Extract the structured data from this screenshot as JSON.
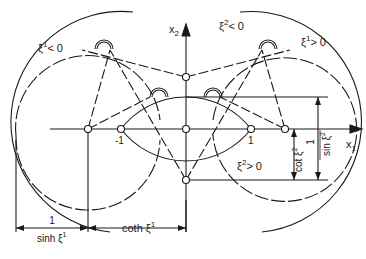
{
  "diagram": {
    "type": "bipolar-coordinate-construction",
    "axes": {
      "x1_label": "x",
      "x1_sub": "1",
      "x2_label": "x",
      "x2_sub": "2"
    },
    "tick_labels": {
      "minus_one": "-1",
      "plus_one": "1"
    },
    "curve_labels": {
      "xi1_neg": {
        "base": "ξ",
        "sup": "1",
        "rel": "< 0"
      },
      "xi2_neg": {
        "base": "ξ",
        "sup": "2",
        "rel": "< 0"
      },
      "xi1_pos": {
        "base": "ξ",
        "sup": "1",
        "rel": "> 0"
      },
      "xi2_pos": {
        "base": "ξ",
        "sup": "2",
        "rel": "> 0"
      }
    },
    "dimensions": {
      "inv_sinh_num": "1",
      "inv_sinh_den": "sinh ξ",
      "inv_sinh_sup": "1",
      "coth": "coth ξ",
      "coth_sup": "1",
      "cot": "cot ξ",
      "cot_sup": "2",
      "inv_sin_num": "1",
      "inv_sin_den": "sin ξ",
      "inv_sin_sup": "2"
    },
    "colors": {
      "ink": "#1a1a1a",
      "background": "#ffffff"
    }
  }
}
